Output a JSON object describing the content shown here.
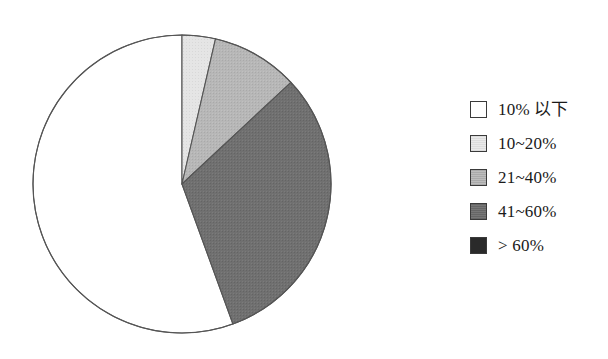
{
  "figure": {
    "background_color": "#ffffff",
    "outline_color": "#555555"
  },
  "chart_data": {
    "type": "pie",
    "title": "",
    "xlabel": "",
    "ylabel": "",
    "grid": false,
    "legend_position": "right",
    "start_angle_deg": 0,
    "direction": "clockwise",
    "categories": [
      "10% 以下",
      "10~20%",
      "21~40%",
      "41~60%",
      "> 60%"
    ],
    "values": [
      55.6,
      3.6,
      9.4,
      31.4,
      0.0
    ],
    "slice_angles_deg": [
      200.0,
      13.0,
      34.0,
      113.0,
      0.0
    ],
    "colors": [
      "#ffffff",
      "#e2e2e2",
      "#b4b4b4",
      "#6e6e6e",
      "#2a2a2a"
    ],
    "edge_color": "#555555",
    "center": {
      "x": 182,
      "y": 184
    },
    "radius": 149,
    "slices": [
      {
        "label": "10% 以下",
        "value": 55.6,
        "color": "#ffffff",
        "start_deg": 160.0,
        "end_deg": 360.0
      },
      {
        "label": "10~20%",
        "value": 3.6,
        "color": "#e2e2e2",
        "start_deg": 0.0,
        "end_deg": 13.0
      },
      {
        "label": "21~40%",
        "value": 9.4,
        "color": "#b4b4b4",
        "start_deg": 13.0,
        "end_deg": 47.0
      },
      {
        "label": "41~60%",
        "value": 31.4,
        "color": "#6e6e6e",
        "start_deg": 47.0,
        "end_deg": 160.0
      },
      {
        "label": "> 60%",
        "value": 0.0,
        "color": "#2a2a2a",
        "start_deg": 160.0,
        "end_deg": 160.0
      }
    ]
  },
  "legend": {
    "items": [
      {
        "label": "10% 以下",
        "color": "#ffffff"
      },
      {
        "label": "10~20%",
        "color": "#e2e2e2"
      },
      {
        "label": "21~40%",
        "color": "#b4b4b4"
      },
      {
        "label": "41~60%",
        "color": "#6e6e6e"
      },
      {
        "label": "> 60%",
        "color": "#2a2a2a"
      }
    ]
  }
}
